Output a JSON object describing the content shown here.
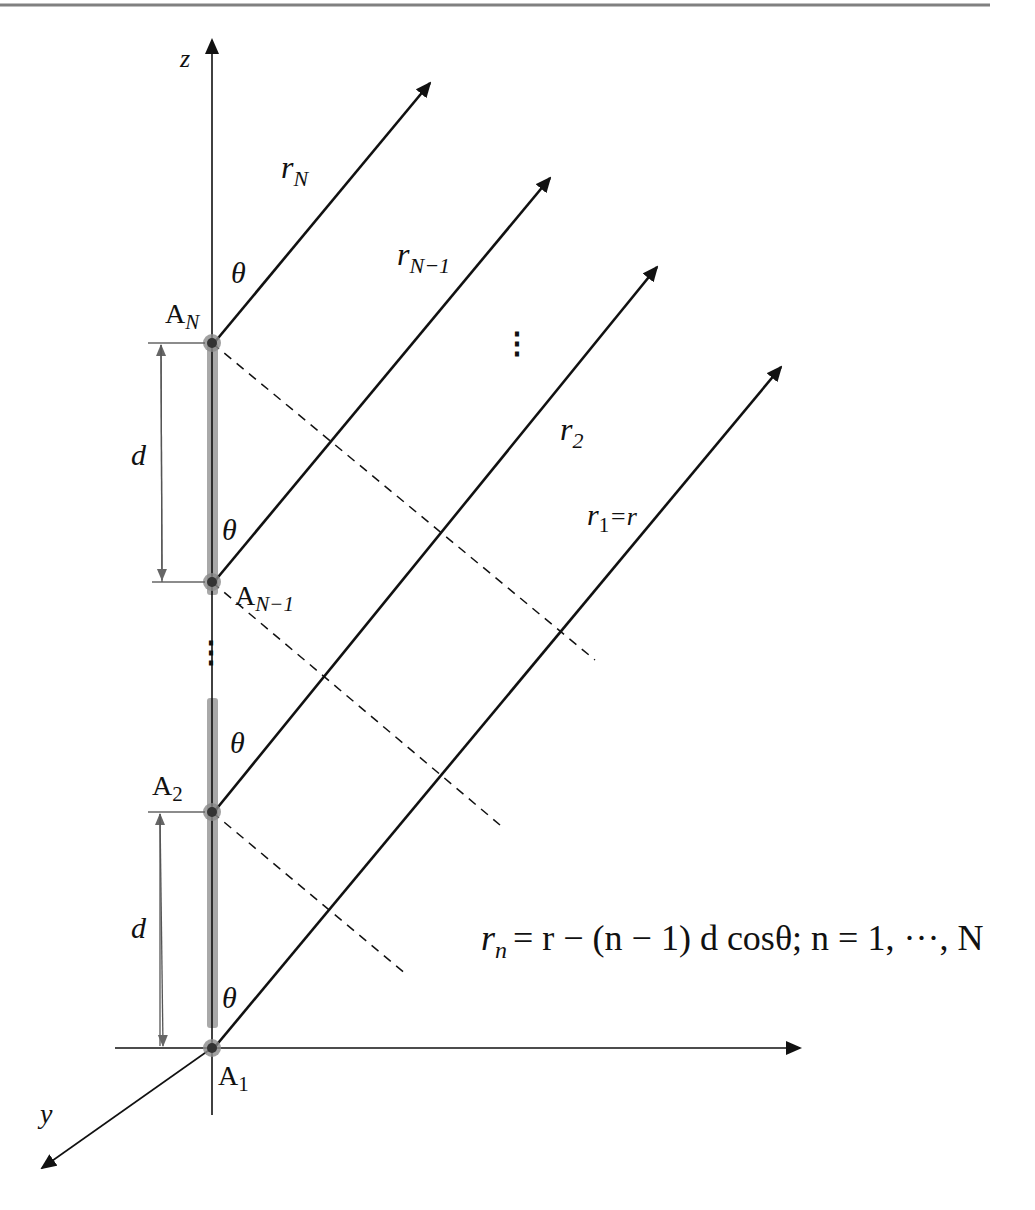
{
  "figure": {
    "type": "uniform linear array geometry",
    "top_rule_color": "#808080",
    "colors": {
      "line": "#111111",
      "element_bar": "#9a9a9a",
      "element_dot": "#333333",
      "dim_line": "#555555"
    }
  },
  "axes": {
    "z_label": "z",
    "y_label": "y",
    "x_label": ""
  },
  "elements": {
    "A_N": {
      "base": "A",
      "sub": "N"
    },
    "A_N_minus_1": {
      "base": "A",
      "sub": "N−1"
    },
    "A_2": {
      "base": "A",
      "sub": "2"
    },
    "A_1": {
      "base": "A",
      "sub": "1"
    }
  },
  "rays": {
    "r_N": {
      "base": "r",
      "sub": "N"
    },
    "r_N_minus_1": {
      "base": "r",
      "sub": "N−1"
    },
    "r_2": {
      "base": "r",
      "sub": "2"
    },
    "r_1": {
      "base": "r",
      "sub": "1",
      "suffix": "=r"
    }
  },
  "angles": {
    "theta": "θ"
  },
  "spacing": {
    "d_label": "d"
  },
  "ellipsis": "⋮",
  "equation": {
    "lhs_base": "r",
    "lhs_sub": "n",
    "rhs": "= r − (n − 1) d cosθ; n = 1, ···, N"
  }
}
